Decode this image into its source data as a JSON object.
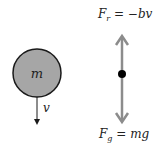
{
  "diagram": {
    "mass": {
      "label": "m",
      "fill": "#a6a6a6",
      "stroke": "#1a1a1a"
    },
    "velocity": {
      "label": "v"
    },
    "free_body": {
      "arrow_color": "#8c8c8c",
      "dot_color": "#000000",
      "upper_force": {
        "F": "F",
        "sub": "r",
        "rhs": " = −bv"
      },
      "lower_force": {
        "F": "F",
        "sub": "g",
        "rhs": " = mg"
      }
    }
  }
}
